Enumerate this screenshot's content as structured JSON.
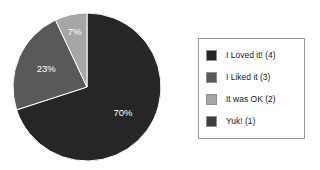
{
  "chart_data": {
    "type": "pie",
    "title": "",
    "subtitle": "",
    "categories": [
      "I Loved it! (4)",
      "I Liked it (3)",
      "It was OK (2)",
      "Yuk! (1)"
    ],
    "values": [
      70,
      23,
      7,
      0
    ],
    "value_unit": "percent",
    "data_labels": [
      "70%",
      "23%",
      "7%",
      ""
    ],
    "visible_slices": [
      {
        "label": "I Loved it! (4)",
        "value": 70,
        "display": "70%",
        "color": "#262626"
      },
      {
        "label": "I Liked it (3)",
        "value": 23,
        "display": "23%",
        "color": "#595959"
      },
      {
        "label": "It was OK (2)",
        "value": 7,
        "display": "7%",
        "color": "#a6a6a6"
      }
    ],
    "colors": [
      "#262626",
      "#595959",
      "#a6a6a6",
      "#3f3f3f"
    ],
    "start_angle_deg": 0,
    "direction": "clockwise",
    "legend_position": "right",
    "grid": false,
    "xlabel": "",
    "ylabel": ""
  },
  "pie": {
    "labels": {
      "slice1": "70%",
      "slice2": "23%",
      "slice3": "7%"
    }
  },
  "legend": {
    "items": [
      {
        "label": "I Loved it! (4)",
        "color": "#262626"
      },
      {
        "label": "I Liked it (3)",
        "color": "#595959"
      },
      {
        "label": "It was OK (2)",
        "color": "#a6a6a6"
      },
      {
        "label": "Yuk! (1)",
        "color": "#3f3f3f"
      }
    ]
  },
  "style": {
    "background": "#ffffff",
    "legend_border": "#9a9a9a",
    "label_text_color": "#ffffff",
    "legend_text_color": "#1a1a1a"
  }
}
